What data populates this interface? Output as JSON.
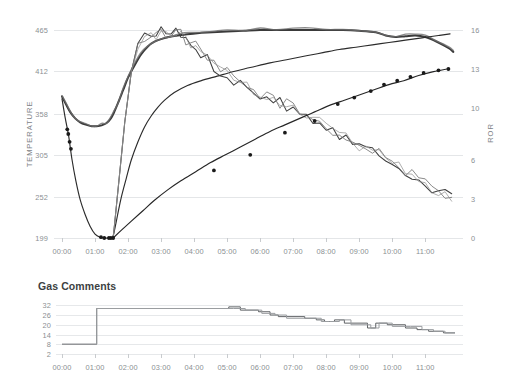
{
  "chart_data": [
    {
      "id": "roast-profile",
      "type": "line",
      "title": "",
      "xlabel": "",
      "ylabel": "TEMPERATURE",
      "y2label": "ROR",
      "grid": true,
      "legend": "none",
      "x_ticks": [
        "00:00",
        "01:00",
        "02:00",
        "03:00",
        "04:00",
        "05:00",
        "06:00",
        "07:00",
        "08:00",
        "09:00",
        "10:00",
        "11:00"
      ],
      "xlim": [
        0,
        11.9
      ],
      "y_ticks": [
        199,
        252,
        305,
        358,
        412,
        465
      ],
      "ylim": [
        199,
        465
      ],
      "y2_ticks": [
        0,
        3,
        6,
        10,
        13,
        16
      ],
      "y2lim": [
        0,
        16
      ],
      "series": [
        {
          "name": "Bean Temperature",
          "axis": "left",
          "style": "dark-thin-with-markers",
          "x": [
            0.0,
            0.1,
            0.2,
            0.3,
            0.42,
            0.55,
            0.7,
            0.85,
            1.0,
            1.15,
            1.3,
            1.42,
            1.5,
            1.55,
            1.62,
            1.7,
            1.8,
            1.95,
            2.1,
            2.3,
            2.5,
            2.7,
            2.9,
            3.1,
            3.4,
            3.8,
            4.2,
            4.7,
            5.2,
            5.7,
            6.3,
            6.8,
            7.4,
            7.9,
            8.4,
            8.9,
            9.4,
            9.9,
            10.4,
            10.9,
            11.4,
            11.75
          ],
          "values": [
            377,
            352,
            330,
            300,
            272,
            248,
            229,
            214,
            204,
            200,
            199,
            199,
            199,
            202,
            215,
            232,
            252,
            276,
            299,
            322,
            341,
            355,
            366,
            375,
            385,
            394,
            400,
            406,
            412,
            417,
            423,
            427,
            432,
            436,
            440,
            443,
            446,
            449,
            452,
            455,
            458,
            460
          ]
        },
        {
          "name": "Environmental Temperature",
          "axis": "left",
          "style": "thick-dark",
          "x": [
            0.0,
            0.12,
            0.25,
            0.4,
            0.55,
            0.72,
            0.9,
            1.05,
            1.2,
            1.35,
            1.48,
            1.58,
            1.7,
            1.85,
            2.0,
            2.2,
            2.4,
            2.6,
            2.8,
            3.05,
            3.35,
            3.7,
            4.1,
            4.55,
            5.0,
            5.5,
            6.0,
            6.5,
            7.0,
            7.5,
            8.0,
            8.5,
            9.0,
            9.5,
            9.8,
            10.1,
            10.4,
            10.7,
            11.0,
            11.35,
            11.7,
            11.85
          ],
          "values": [
            380,
            370,
            360,
            352,
            347,
            344,
            342,
            342,
            343,
            346,
            352,
            360,
            372,
            388,
            404,
            420,
            434,
            444,
            450,
            454,
            457,
            459,
            461,
            462,
            463,
            464,
            465,
            465,
            465,
            465,
            465,
            465,
            464,
            462,
            458,
            456,
            457,
            458,
            456,
            450,
            442,
            437
          ]
        },
        {
          "name": "Rate of Rise (ROR)",
          "axis": "right",
          "style": "noisy-descending",
          "x": [
            1.55,
            1.7,
            1.9,
            2.1,
            2.3,
            2.5,
            2.7,
            2.85,
            3.0,
            3.15,
            3.3,
            3.45,
            3.6,
            3.75,
            3.9,
            4.05,
            4.2,
            4.4,
            4.6,
            4.8,
            5.0,
            5.2,
            5.4,
            5.6,
            5.8,
            6.0,
            6.2,
            6.4,
            6.6,
            6.8,
            7.0,
            7.2,
            7.4,
            7.6,
            7.8,
            8.0,
            8.2,
            8.4,
            8.6,
            8.8,
            9.0,
            9.2,
            9.4,
            9.6,
            9.8,
            10.0,
            10.2,
            10.4,
            10.6,
            10.8,
            11.0,
            11.2,
            11.4,
            11.6,
            11.8
          ],
          "values": [
            0.0,
            3.8,
            8.9,
            12.8,
            14.6,
            15.5,
            15.8,
            15.6,
            15.9,
            15.7,
            15.9,
            15.8,
            15.6,
            15.3,
            15.0,
            14.6,
            14.2,
            13.7,
            13.2,
            12.9,
            12.6,
            12.2,
            11.9,
            11.6,
            11.3,
            11.1,
            10.9,
            10.7,
            10.5,
            10.2,
            10.0,
            9.7,
            9.5,
            9.2,
            8.9,
            8.6,
            8.3,
            8.0,
            7.7,
            7.4,
            7.1,
            6.9,
            6.8,
            6.6,
            6.3,
            5.9,
            5.5,
            5.2,
            4.8,
            4.4,
            4.1,
            3.8,
            3.5,
            3.3,
            3.1
          ]
        },
        {
          "name": "Delta BT",
          "axis": "right",
          "style": "rising-with-markers",
          "x": [
            1.55,
            1.8,
            2.1,
            2.45,
            2.8,
            3.2,
            3.6,
            4.05,
            4.5,
            4.95,
            5.4,
            5.85,
            6.3,
            6.75,
            7.2,
            7.65,
            8.1,
            8.55,
            9.0,
            9.45,
            9.9,
            10.35,
            10.8,
            11.25,
            11.65
          ],
          "values": [
            0.0,
            0.6,
            1.3,
            2.1,
            2.9,
            3.7,
            4.4,
            5.1,
            5.8,
            6.4,
            7.0,
            7.6,
            8.2,
            8.7,
            9.2,
            9.7,
            10.2,
            10.6,
            11.0,
            11.4,
            11.8,
            12.1,
            12.5,
            12.8,
            13.0
          ]
        }
      ],
      "markers": {
        "bt_early": [
          {
            "x": 0.16,
            "y": 338
          },
          {
            "x": 0.19,
            "y": 332
          },
          {
            "x": 0.23,
            "y": 322
          },
          {
            "x": 0.27,
            "y": 313
          },
          {
            "x": 1.18,
            "y": 200
          },
          {
            "x": 1.28,
            "y": 199
          },
          {
            "x": 1.42,
            "y": 199
          },
          {
            "x": 1.48,
            "y": 199
          }
        ],
        "delta_points": [
          {
            "x": 1.55,
            "ror": 0.0
          },
          {
            "x": 4.6,
            "ror": 5.2
          },
          {
            "x": 5.7,
            "ror": 6.4
          },
          {
            "x": 6.75,
            "ror": 8.1
          },
          {
            "x": 7.65,
            "ror": 9.0
          },
          {
            "x": 8.35,
            "ror": 10.3
          },
          {
            "x": 8.85,
            "ror": 10.8
          },
          {
            "x": 9.35,
            "ror": 11.3
          },
          {
            "x": 9.75,
            "ror": 11.8
          },
          {
            "x": 10.15,
            "ror": 12.1
          },
          {
            "x": 10.55,
            "ror": 12.4
          },
          {
            "x": 10.95,
            "ror": 12.7
          },
          {
            "x": 11.4,
            "ror": 12.9
          },
          {
            "x": 11.7,
            "ror": 13.0
          }
        ]
      }
    },
    {
      "id": "gas-comments",
      "type": "line",
      "title": "Gas Comments",
      "xlabel": "",
      "ylabel": "",
      "grid": true,
      "legend": "none",
      "x_ticks": [
        "00:00",
        "01:00",
        "02:00",
        "03:00",
        "04:00",
        "05:00",
        "06:00",
        "07:00",
        "08:00",
        "09:00",
        "10:00",
        "11:00"
      ],
      "xlim": [
        0,
        11.9
      ],
      "y_ticks": [
        2,
        8,
        14,
        20,
        26,
        32
      ],
      "ylim": [
        2,
        34
      ],
      "series": [
        {
          "name": "Gas setting (primary)",
          "style": "step",
          "x": [
            0.0,
            1.05,
            1.05,
            5.05,
            5.05,
            5.4,
            5.4,
            5.95,
            5.95,
            6.3,
            6.3,
            6.55,
            6.55,
            7.35,
            7.35,
            7.7,
            7.7,
            7.95,
            7.95,
            8.25,
            8.25,
            8.55,
            8.55,
            9.25,
            9.25,
            9.5,
            9.5,
            9.85,
            9.85,
            10.4,
            10.4,
            10.75,
            10.75,
            11.1,
            11.1,
            11.55,
            11.55,
            11.9
          ],
          "values": [
            8,
            8,
            30,
            30,
            31,
            31,
            29,
            29,
            28,
            28,
            26,
            26,
            25,
            25,
            24,
            24,
            23,
            23,
            22,
            22,
            23,
            23,
            21,
            21,
            18,
            18,
            21,
            21,
            20,
            20,
            18,
            18,
            17,
            17,
            16,
            16,
            15,
            15
          ]
        },
        {
          "name": "Gas setting (background)",
          "style": "step",
          "x": [
            0.0,
            1.05,
            1.05,
            5.2,
            5.2,
            5.55,
            5.55,
            6.05,
            6.05,
            6.45,
            6.45,
            6.8,
            6.8,
            7.45,
            7.45,
            7.85,
            7.85,
            8.1,
            8.1,
            8.4,
            8.4,
            8.75,
            8.75,
            9.35,
            9.35,
            9.6,
            9.6,
            10.0,
            10.0,
            10.55,
            10.55,
            10.9,
            10.9,
            11.25,
            11.25,
            11.6,
            11.6,
            11.9
          ],
          "values": [
            8,
            8,
            30,
            30,
            30,
            30,
            29,
            29,
            27,
            27,
            26,
            26,
            24,
            24,
            24,
            24,
            22,
            22,
            22,
            22,
            23,
            23,
            20,
            20,
            18,
            18,
            21,
            21,
            19,
            19,
            19,
            19,
            17,
            17,
            16,
            16,
            15,
            15
          ]
        }
      ]
    }
  ]
}
